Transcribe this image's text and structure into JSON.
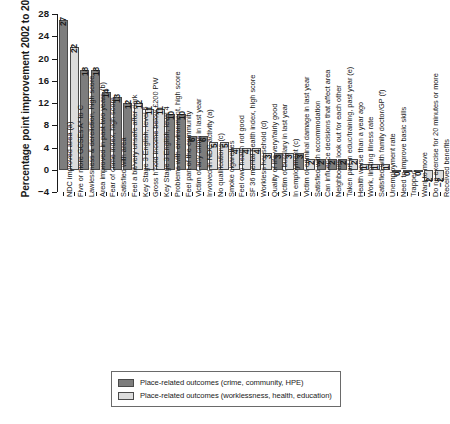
{
  "chart_data": {
    "type": "bar",
    "title": "",
    "xlabel": "",
    "ylabel": "Percentage point improvement 2002 to 2008",
    "ylim": [
      -4,
      28
    ],
    "yticks": [
      -4,
      0,
      4,
      8,
      12,
      16,
      20,
      24,
      28
    ],
    "grid": false,
    "legend_position": "bottom-center",
    "series": [
      {
        "name": "Place-related outcomes (crime, community, HPE)",
        "color": "#7d7d7d"
      },
      {
        "name": "Place-related outcomes (worklessness, health, education)",
        "color": "#dcdcdc"
      }
    ],
    "categories": [
      "NDC improved area (a)",
      "Five or more GCSEs A* to C",
      "Lawlessness & dereliction, high score",
      "Area improved in past two years (b)",
      "Fear of crime index, high score",
      "Satisfied with area",
      "Feel a bit/very unsafe after dark",
      "Key Stage 3 English, level 5",
      "Gross h'hold income below £200 PW",
      "Key Stage 3 English, level 4",
      "Problems with environment, high score",
      "Feel part of the community",
      "Victim of any crime in last year",
      "Involved in NDC activity (a)",
      "No qualifications (c)",
      "Smoke cigarettes",
      "Feel own health not good",
      "SF 36 mental health index, high score",
      "Workless household (d)",
      "Quality of life very/fairly good",
      "Victim of burglary in last year",
      "In employment (c)",
      "Victim of criminal damage in last year",
      "Satisfied with accommodation",
      "Can influence decisions that affect area",
      "Neighbours look out for each other",
      "Taken part in educ/training, past year (e)",
      "Health worse than a year ago",
      "Work, limiting illness rate",
      "Satisfied with family doctor/GP (f)",
      "Unemployment rate",
      "Need to improve basic skills",
      "Trapped",
      "Want to move",
      "Do no exercise for 20 minutes or more",
      "Received benefits"
    ],
    "values": [
      27,
      22,
      18,
      18,
      14,
      13,
      12,
      12,
      11,
      11,
      10,
      10,
      6,
      6,
      5,
      5,
      4,
      4,
      4,
      3,
      3,
      3,
      3,
      2,
      2,
      2,
      2,
      2,
      1,
      1,
      1,
      0,
      0,
      0,
      -2,
      -2
    ],
    "group_of_each_bar": [
      0,
      1,
      0,
      0,
      0,
      0,
      0,
      1,
      1,
      1,
      0,
      0,
      0,
      0,
      1,
      1,
      1,
      1,
      1,
      1,
      0,
      1,
      0,
      1,
      0,
      0,
      0,
      1,
      1,
      1,
      1,
      1,
      0,
      0,
      1,
      1
    ]
  },
  "legend": {
    "items": [
      {
        "label": "Place-related outcomes (crime, community, HPE)",
        "color": "#7d7d7d"
      },
      {
        "label": "Place-related outcomes (worklessness, health, education)",
        "color": "#dcdcdc"
      }
    ]
  }
}
